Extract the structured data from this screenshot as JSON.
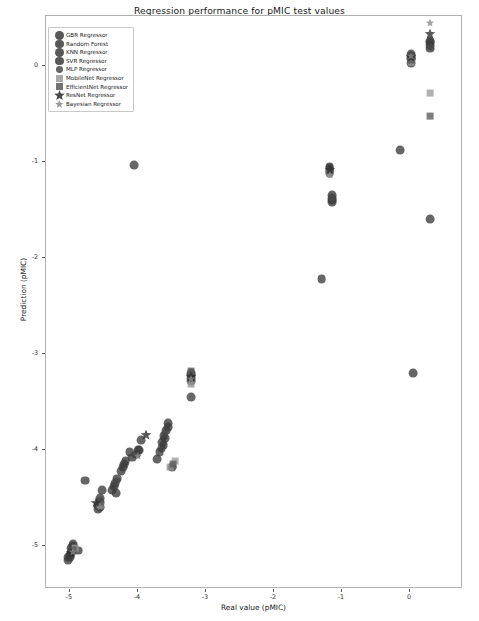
{
  "title": "Regression performance for pMIC test values",
  "axes": {
    "xlabel": "Real value (pMIC)",
    "ylabel": "Prediction (pMIC)",
    "xticks": [
      "-5",
      "-4",
      "-3",
      "-2",
      "-1",
      "0"
    ],
    "yticks": [
      "0",
      "-1",
      "-2",
      "-3",
      "-4",
      "-5"
    ]
  },
  "legend": {
    "position": "upper-left",
    "items": [
      {
        "label": "GBR Regressor",
        "marker": "circle",
        "color": "#3b3b3b",
        "size": 4.4
      },
      {
        "label": "Random Forest",
        "marker": "circle",
        "color": "#3b3b3b",
        "size": 4.4
      },
      {
        "label": "KNN Regressor",
        "marker": "circle",
        "color": "#3b3b3b",
        "size": 4.4
      },
      {
        "label": "SVR Regressor",
        "marker": "circle",
        "color": "#3b3b3b",
        "size": 4.4
      },
      {
        "label": "MLP Regressor",
        "marker": "circle",
        "color": "#4a4a4a",
        "size": 3.4
      },
      {
        "label": "MobileNet Regressor",
        "marker": "square",
        "color": "#9a9a9a",
        "size": 3.6
      },
      {
        "label": "EfficientNet Regressor",
        "marker": "square",
        "color": "#5a5a5a",
        "size": 3.6
      },
      {
        "label": "ResNet Regressor",
        "marker": "star",
        "color": "#2b2b2b",
        "size": 4.6
      },
      {
        "label": "Bayesian Regressor",
        "marker": "star",
        "color": "#8a8a8a",
        "size": 3.6
      }
    ]
  },
  "chart_data": {
    "type": "scatter",
    "title": "Regression performance for pMIC test values",
    "xlabel": "Real value (pMIC)",
    "ylabel": "Prediction (pMIC)",
    "xlim": [
      -5.35,
      0.78
    ],
    "ylim": [
      -5.45,
      0.52
    ],
    "grid": false,
    "series": [
      {
        "name": "GBR Regressor",
        "marker": "circle",
        "color": "#3b3b3b",
        "size": 4.4,
        "points": [
          [
            0.3,
            0.25
          ],
          [
            0.02,
            0.1
          ],
          [
            0.02,
            0.03
          ],
          [
            -0.15,
            -0.88
          ],
          [
            0.3,
            -1.6
          ],
          [
            0.05,
            -3.2
          ],
          [
            -1.18,
            -1.06
          ],
          [
            -1.18,
            -1.12
          ],
          [
            -1.15,
            -1.38
          ],
          [
            -1.3,
            -2.22
          ],
          [
            -3.22,
            -3.22
          ],
          [
            -3.22,
            -3.45
          ],
          [
            -3.55,
            -3.72
          ],
          [
            -3.62,
            -3.86
          ],
          [
            -3.62,
            -3.95
          ],
          [
            -3.72,
            -4.1
          ],
          [
            -3.5,
            -4.18
          ],
          [
            -3.95,
            -3.9
          ],
          [
            -3.98,
            -4.0
          ],
          [
            -4.05,
            -1.03
          ],
          [
            -4.12,
            -4.02
          ],
          [
            -4.18,
            -4.12
          ],
          [
            -4.3,
            -4.3
          ],
          [
            -4.32,
            -4.45
          ],
          [
            -4.52,
            -4.42
          ],
          [
            -4.55,
            -4.55
          ],
          [
            -4.58,
            -4.62
          ],
          [
            -4.78,
            -4.32
          ],
          [
            -4.95,
            -4.98
          ],
          [
            -4.98,
            -5.08
          ],
          [
            -5.02,
            -5.12
          ],
          [
            -4.88,
            -5.05
          ]
        ]
      },
      {
        "name": "Random Forest",
        "marker": "circle",
        "color": "#3b3b3b",
        "size": 4.4,
        "points": [
          [
            0.3,
            0.18
          ],
          [
            0.02,
            0.07
          ],
          [
            -1.18,
            -1.1
          ],
          [
            -1.15,
            -1.42
          ],
          [
            -3.22,
            -3.25
          ],
          [
            -3.58,
            -3.8
          ],
          [
            -3.65,
            -3.98
          ],
          [
            -4.02,
            -4.05
          ],
          [
            -4.22,
            -4.18
          ],
          [
            -4.35,
            -4.38
          ],
          [
            -4.55,
            -4.5
          ],
          [
            -4.98,
            -5.02
          ],
          [
            -5.0,
            -5.1
          ]
        ]
      },
      {
        "name": "KNN Regressor",
        "marker": "circle",
        "color": "#3b3b3b",
        "size": 4.4,
        "points": [
          [
            0.3,
            0.22
          ],
          [
            0.02,
            0.12
          ],
          [
            -1.18,
            -1.08
          ],
          [
            -1.15,
            -1.35
          ],
          [
            -3.22,
            -3.2
          ],
          [
            -3.6,
            -3.88
          ],
          [
            -3.68,
            -4.02
          ],
          [
            -4.08,
            -4.08
          ],
          [
            -4.25,
            -4.22
          ],
          [
            -4.38,
            -4.42
          ],
          [
            -4.58,
            -4.58
          ],
          [
            -4.95,
            -5.0
          ],
          [
            -5.02,
            -5.15
          ]
        ]
      },
      {
        "name": "SVR Regressor",
        "marker": "circle",
        "color": "#3b3b3b",
        "size": 4.4,
        "points": [
          [
            0.3,
            0.26
          ],
          [
            0.02,
            0.08
          ],
          [
            -1.18,
            -1.05
          ],
          [
            -1.15,
            -1.4
          ],
          [
            -3.22,
            -3.28
          ],
          [
            -3.56,
            -3.76
          ],
          [
            -3.64,
            -3.92
          ],
          [
            -4.0,
            -4.0
          ],
          [
            -4.2,
            -4.15
          ],
          [
            -4.33,
            -4.35
          ],
          [
            -4.56,
            -4.6
          ],
          [
            -4.97,
            -5.05
          ],
          [
            -4.99,
            -5.12
          ]
        ]
      },
      {
        "name": "MLP Regressor",
        "marker": "circle",
        "color": "#4a4a4a",
        "size": 3.4,
        "points": [
          [
            0.02,
            0.05
          ],
          [
            0.3,
            0.2
          ],
          [
            -1.18,
            -1.1
          ],
          [
            -1.15,
            -1.38
          ],
          [
            -3.22,
            -3.22
          ],
          [
            -3.6,
            -3.82
          ],
          [
            -4.05,
            -4.05
          ],
          [
            -4.3,
            -4.32
          ],
          [
            -4.55,
            -4.52
          ],
          [
            -4.98,
            -5.06
          ]
        ]
      },
      {
        "name": "MobileNet Regressor",
        "marker": "square",
        "color": "#9a9a9a",
        "size": 3.6,
        "points": [
          [
            0.3,
            -0.28
          ],
          [
            0.02,
            0.04
          ],
          [
            -1.18,
            -1.12
          ],
          [
            -3.22,
            -3.32
          ],
          [
            -3.45,
            -4.12
          ],
          [
            -3.52,
            -4.18
          ],
          [
            -4.55,
            -4.58
          ],
          [
            -4.92,
            -5.02
          ]
        ]
      },
      {
        "name": "EfficientNet Regressor",
        "marker": "square",
        "color": "#5a5a5a",
        "size": 3.6,
        "points": [
          [
            0.3,
            -0.52
          ],
          [
            0.02,
            0.06
          ],
          [
            -1.18,
            -1.1
          ],
          [
            -3.22,
            -3.18
          ],
          [
            -3.48,
            -4.15
          ],
          [
            -4.56,
            -4.56
          ],
          [
            -4.95,
            -5.04
          ]
        ]
      },
      {
        "name": "ResNet Regressor",
        "marker": "star",
        "color": "#2b2b2b",
        "size": 4.6,
        "points": [
          [
            0.3,
            0.33
          ],
          [
            0.02,
            0.09
          ],
          [
            -1.18,
            -1.08
          ],
          [
            -3.22,
            -3.24
          ],
          [
            -3.88,
            -3.85
          ],
          [
            -4.62,
            -4.55
          ],
          [
            -4.98,
            -5.08
          ]
        ]
      },
      {
        "name": "Bayesian Regressor",
        "marker": "star",
        "color": "#8a8a8a",
        "size": 3.6,
        "points": [
          [
            0.3,
            0.45
          ],
          [
            0.02,
            0.1
          ],
          [
            -1.18,
            -1.14
          ],
          [
            -3.22,
            -3.26
          ],
          [
            -4.0,
            -4.06
          ],
          [
            -4.55,
            -4.6
          ],
          [
            -4.96,
            -5.06
          ]
        ]
      }
    ]
  }
}
